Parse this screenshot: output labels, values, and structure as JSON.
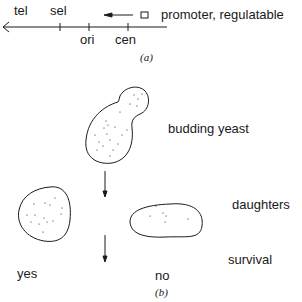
{
  "panel_a": {
    "labels": {
      "tel": "tel",
      "sel": "sel",
      "ori": "ori",
      "cen": "cen",
      "promoter": "promoter, regulatable"
    },
    "caption": "(a)"
  },
  "panel_b": {
    "labels": {
      "budding_yeast": "budding yeast",
      "daughters": "daughters",
      "survival": "survival",
      "yes": "yes",
      "no": "no"
    },
    "caption": "(b)"
  },
  "colors": {
    "ink": "#1a1a1a",
    "background": "#ffffff"
  }
}
